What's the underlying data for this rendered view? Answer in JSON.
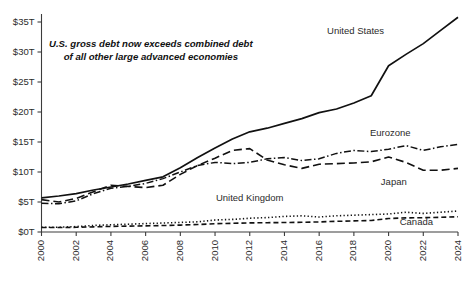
{
  "chart_data": {
    "type": "line",
    "title": "",
    "xlabel": "",
    "ylabel": "",
    "xlim": [
      2000,
      2024
    ],
    "ylim": [
      0,
      35
    ],
    "grid": false,
    "legend_position": "inline-labels",
    "y_tick_labels": [
      "$0T",
      "$5T",
      "$10T",
      "$15T",
      "$20T",
      "$25T",
      "$30T",
      "$35T"
    ],
    "y_tick_values": [
      0,
      5,
      10,
      15,
      20,
      25,
      30,
      35
    ],
    "x_tick_labels": [
      "2000",
      "2002",
      "2004",
      "2006",
      "2008",
      "2010",
      "2012",
      "2014",
      "2016",
      "2018",
      "2020",
      "2022",
      "2024"
    ],
    "x_tick_values": [
      2000,
      2002,
      2004,
      2006,
      2008,
      2010,
      2012,
      2014,
      2016,
      2018,
      2020,
      2022,
      2024
    ],
    "x": [
      2000,
      2001,
      2002,
      2003,
      2004,
      2005,
      2006,
      2007,
      2008,
      2009,
      2010,
      2011,
      2012,
      2013,
      2014,
      2015,
      2016,
      2017,
      2018,
      2019,
      2020,
      2021,
      2022,
      2023,
      2024
    ],
    "annotations": [
      {
        "name": "headline-annotation",
        "line1": "U.S. gross debt now exceeds combined debt",
        "line2": "of all other large advanced economies",
        "x": 2006.3,
        "y": 31.2
      }
    ],
    "series": [
      {
        "name": "United States",
        "label": "United States",
        "style": "solid",
        "dasharray": "none",
        "stroke_width": 1.7,
        "color": "#111111",
        "label_x": 2018.1,
        "label_y": 33.4,
        "values": [
          5.7,
          6.0,
          6.4,
          7.0,
          7.5,
          8.0,
          8.6,
          9.2,
          10.7,
          12.4,
          14.0,
          15.5,
          16.7,
          17.3,
          18.1,
          18.9,
          19.9,
          20.5,
          21.5,
          22.7,
          27.7,
          29.6,
          31.4,
          33.6,
          35.8
        ]
      },
      {
        "name": "Eurozone",
        "label": "Eurozone",
        "style": "dashdot",
        "dasharray": "7,2.5,1.5,2.5",
        "stroke_width": 1.5,
        "color": "#111111",
        "label_x": 2020.1,
        "label_y": 16.4,
        "values": [
          4.8,
          4.7,
          5.2,
          6.4,
          7.3,
          7.6,
          8.1,
          8.9,
          10.0,
          11.1,
          11.6,
          11.4,
          11.6,
          12.2,
          12.4,
          11.9,
          12.2,
          13.1,
          13.6,
          13.4,
          13.8,
          14.4,
          13.6,
          14.2,
          14.6
        ]
      },
      {
        "name": "Japan",
        "label": "Japan",
        "style": "dashed",
        "dasharray": "8,4",
        "stroke_width": 1.6,
        "color": "#111111",
        "label_x": 2020.3,
        "label_y": 8.3,
        "values": [
          5.4,
          5.0,
          5.6,
          6.7,
          7.8,
          7.6,
          7.4,
          7.8,
          9.6,
          11.1,
          12.3,
          13.6,
          13.9,
          12.0,
          11.2,
          10.6,
          11.3,
          11.4,
          11.5,
          11.7,
          12.5,
          11.6,
          10.3,
          10.3,
          10.6
        ]
      },
      {
        "name": "United Kingdom",
        "label": "United Kingdom",
        "style": "dotted",
        "dasharray": "1.3,2.3",
        "stroke_width": 1.6,
        "color": "#111111",
        "label_x": 2012.0,
        "label_y": 5.6,
        "values": [
          0.8,
          0.8,
          0.9,
          1.1,
          1.2,
          1.3,
          1.4,
          1.5,
          1.6,
          1.7,
          2.0,
          2.1,
          2.3,
          2.4,
          2.6,
          2.7,
          2.5,
          2.7,
          2.8,
          2.9,
          3.0,
          3.3,
          3.1,
          3.3,
          3.5
        ]
      },
      {
        "name": "Canada",
        "label": "Canada",
        "style": "shortdash",
        "dasharray": "5,3",
        "stroke_width": 1.6,
        "color": "#111111",
        "label_x": 2021.6,
        "label_y": 1.6,
        "values": [
          0.75,
          0.75,
          0.78,
          0.86,
          0.93,
          0.98,
          1.02,
          1.08,
          1.15,
          1.25,
          1.38,
          1.45,
          1.52,
          1.55,
          1.58,
          1.62,
          1.68,
          1.78,
          1.85,
          1.92,
          2.25,
          2.35,
          2.38,
          2.45,
          2.55
        ]
      }
    ]
  }
}
